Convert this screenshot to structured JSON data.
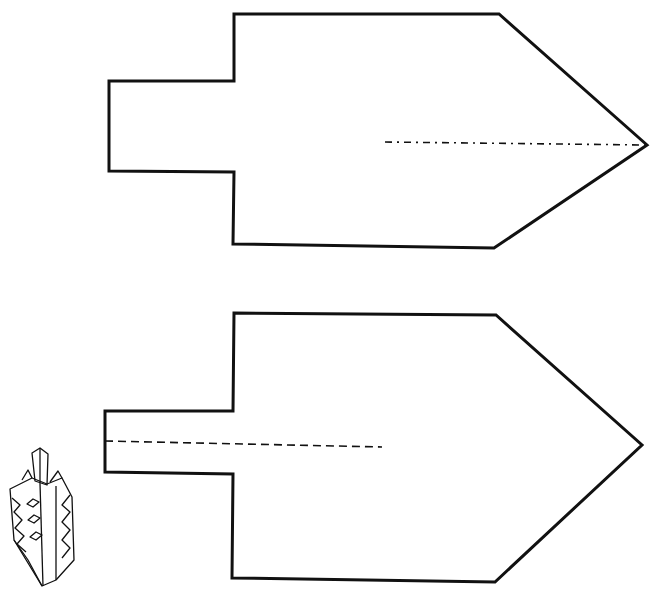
{
  "page": {
    "title_text_cropped": ""
  },
  "colors": {
    "background": "#ffffff",
    "line": "#111111"
  },
  "pieces": [
    {
      "name": "pattern-piece-top",
      "outline_points": "234,14 499,14 647,145 494,248 233,244 234,172 109,171 109,81 234,81",
      "fold_line": {
        "x1": 385,
        "y1": 142,
        "x2": 645,
        "y2": 145,
        "style": "dash-dot"
      }
    },
    {
      "name": "pattern-piece-bottom",
      "outline_points": "234,313 496,315 642,445 495,582 232,578 233,474 105,472 105,411 233,411",
      "fold_line": {
        "x1": 105,
        "y1": 441,
        "x2": 382,
        "y2": 447,
        "style": "dashed"
      }
    }
  ],
  "illustration": {
    "label": "assembled-dreidel-illustration"
  }
}
